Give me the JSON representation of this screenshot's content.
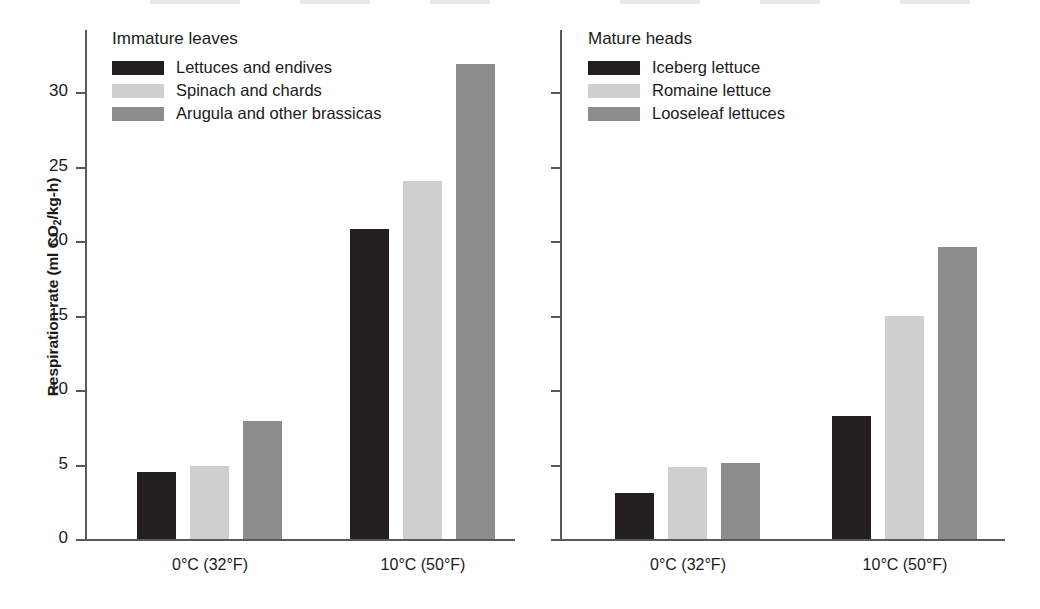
{
  "chart_data": {
    "type": "bar",
    "title": "",
    "xlabel": "",
    "ylabel": "Respiration rate (ml CO2/kg-h)",
    "ylabel_parts": {
      "pre": "Respiration rate (ml CO",
      "sub": "2",
      "post": "/kg-h)"
    },
    "ylim": [
      0,
      34
    ],
    "yticks": [
      0,
      5,
      10,
      15,
      20,
      25,
      30
    ],
    "ytick_labels": [
      "0",
      "5",
      "10",
      "15",
      "20",
      "25",
      "30"
    ],
    "grid": false,
    "legend_position": "inside-top-left",
    "categories": [
      "0°C (32°F)",
      "10°C (50°F)"
    ],
    "panels": [
      {
        "name": "immature-leaves",
        "legend_title": "Immature leaves",
        "series": [
          {
            "name": "Lettuces and endives",
            "color": "#231f20",
            "values": [
              4.5,
              20.7
            ]
          },
          {
            "name": "Spinach and chards",
            "color": "#cfcfcf",
            "values": [
              4.9,
              23.9
            ]
          },
          {
            "name": "Arugula and other brassicas",
            "color": "#8c8c8c",
            "values": [
              7.9,
              31.7
            ]
          }
        ]
      },
      {
        "name": "mature-heads",
        "legend_title": "Mature heads",
        "series": [
          {
            "name": "Iceberg lettuce",
            "color": "#231f20",
            "values": [
              3.1,
              8.2
            ]
          },
          {
            "name": "Romaine lettuce",
            "color": "#cfcfcf",
            "values": [
              4.8,
              14.9
            ]
          },
          {
            "name": "Looseleaf lettuces",
            "color": "#8c8c8c",
            "values": [
              5.1,
              19.5
            ]
          }
        ]
      }
    ]
  },
  "colors": {
    "dark": "#231f20",
    "light": "#cfcfcf",
    "mid": "#8c8c8c",
    "axis": "#58585a",
    "text": "#1a1a1a"
  }
}
